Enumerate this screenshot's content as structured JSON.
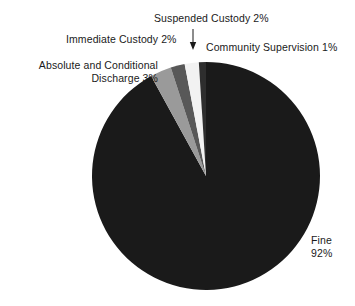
{
  "chart_data": {
    "type": "pie",
    "title": "",
    "subtitle": "",
    "xlabel": "",
    "ylabel": "",
    "legend_position": "none",
    "grid": false,
    "units": "percent",
    "categories": [
      "Fine",
      "Absolute and Conditional Discharge",
      "Immediate Custody",
      "Suspended Custody",
      "Community Supervision"
    ],
    "values": [
      92,
      3,
      2,
      2,
      1
    ],
    "colors": [
      "#1a1a1a",
      "#9a9a9a",
      "#585858",
      "#f2f2f2",
      "#2e2e2e"
    ],
    "slices": [
      {
        "name": "Fine",
        "value": 92,
        "value_label": "92%",
        "color": "#1a1a1a",
        "start_angle": 0,
        "end_angle": 331.2
      },
      {
        "name": "Absolute and Conditional Discharge",
        "value": 3,
        "value_label": "3%",
        "color": "#9a9a9a",
        "start_angle": 331.2,
        "end_angle": 342.0
      },
      {
        "name": "Immediate Custody",
        "value": 2,
        "value_label": "2%",
        "color": "#585858",
        "start_angle": 342.0,
        "end_angle": 349.2
      },
      {
        "name": "Suspended Custody",
        "value": 2,
        "value_label": "2%",
        "color": "#f2f2f2",
        "start_angle": 349.2,
        "end_angle": 356.4
      },
      {
        "name": "Community Supervision",
        "value": 1,
        "value_label": "1%",
        "color": "#2e2e2e",
        "start_angle": 356.4,
        "end_angle": 360.0
      }
    ]
  },
  "labels": {
    "suspended_custody": "Suspended Custody 2%",
    "immediate_custody": "Immediate Custody 2%",
    "community_supervision": "Community Supervision 1%",
    "absolute_discharge_line1": "Absolute and Conditional",
    "absolute_discharge_line2": "Discharge 3%",
    "fine_line1": "Fine",
    "fine_line2": "92%"
  },
  "annotations": {
    "suspended_arrow": "down-arrow-icon"
  }
}
